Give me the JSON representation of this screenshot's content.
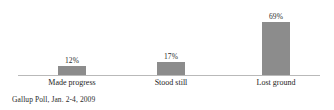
{
  "chart_data": {
    "type": "bar",
    "title": "",
    "subtitle": "",
    "xlabel": "",
    "ylabel": "",
    "categories": [
      "Made progress",
      "Stood still",
      "Lost ground"
    ],
    "values": [
      12,
      17,
      69
    ],
    "value_labels": [
      "12%",
      "17%",
      "69%"
    ],
    "ylim": [
      0,
      75
    ],
    "grid": false,
    "legend": null,
    "bar_color": "#8c8c8c",
    "axis_color": "#b9b9b9",
    "text_color": "#1d1d1d",
    "background": "#ffffff",
    "source": "Gallup Poll, Jan. 2-4, 2009"
  },
  "bars": [
    {
      "label": "Made progress",
      "value_label": "12%",
      "value": 12
    },
    {
      "label": "Stood still",
      "value_label": "17%",
      "value": 17
    },
    {
      "label": "Lost ground",
      "value_label": "69%",
      "value": 69
    }
  ],
  "caption": {
    "source": "Gallup Poll, Jan. 2-4, 2009"
  }
}
